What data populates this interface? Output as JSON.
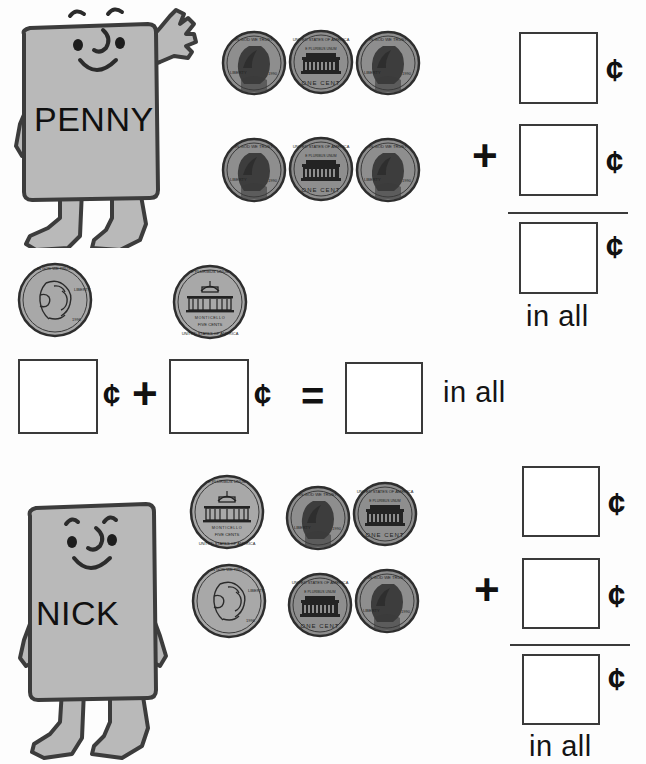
{
  "worksheet": {
    "background": "#fdfdfd",
    "ink": "#1a1a1a",
    "body_fill": "#b9b9b9",
    "coin_fill": "#8e8e8e",
    "width": 646,
    "height": 764
  },
  "symbols": {
    "cent": "¢",
    "plus": "+",
    "equals": "=",
    "in_all": "in all"
  },
  "problems": [
    {
      "id": "problem-1",
      "character": {
        "name": "PENNY",
        "pose": "waving"
      },
      "coins": [
        {
          "type": "penny",
          "face": "obverse"
        },
        {
          "type": "penny",
          "face": "reverse"
        },
        {
          "type": "penny",
          "face": "obverse"
        },
        {
          "type": "penny",
          "face": "obverse"
        },
        {
          "type": "penny",
          "face": "reverse"
        },
        {
          "type": "penny",
          "face": "obverse"
        }
      ],
      "format": "vertical",
      "answer_boxes": [
        {
          "slot": "addend-1",
          "value": "",
          "unit": "¢"
        },
        {
          "slot": "addend-2",
          "value": "",
          "unit": "¢"
        },
        {
          "slot": "sum",
          "value": "",
          "unit": "¢",
          "label": "in all"
        }
      ]
    },
    {
      "id": "problem-2",
      "character": null,
      "coins": [
        {
          "type": "nickel",
          "face": "obverse"
        },
        {
          "type": "nickel",
          "face": "reverse"
        }
      ],
      "format": "horizontal",
      "answer_boxes": [
        {
          "slot": "addend-1",
          "value": "",
          "unit": "¢"
        },
        {
          "slot": "addend-2",
          "value": "",
          "unit": "¢"
        },
        {
          "slot": "sum",
          "value": "",
          "unit": "",
          "label": "in all"
        }
      ]
    },
    {
      "id": "problem-3",
      "character": {
        "name": "NICK",
        "pose": "arms-down"
      },
      "coins": [
        {
          "type": "nickel",
          "face": "reverse"
        },
        {
          "type": "penny",
          "face": "obverse"
        },
        {
          "type": "penny",
          "face": "reverse"
        },
        {
          "type": "nickel",
          "face": "obverse"
        },
        {
          "type": "penny",
          "face": "reverse"
        },
        {
          "type": "penny",
          "face": "obverse"
        }
      ],
      "format": "vertical",
      "answer_boxes": [
        {
          "slot": "addend-1",
          "value": "",
          "unit": "¢"
        },
        {
          "slot": "addend-2",
          "value": "",
          "unit": "¢"
        },
        {
          "slot": "sum",
          "value": "",
          "unit": "¢",
          "label": "in all"
        }
      ]
    }
  ],
  "coin_legends": {
    "penny_obverse": {
      "motto": "IN GOD WE TRUST",
      "liberty": "LIBERTY",
      "date": "1990"
    },
    "penny_reverse": {
      "country": "UNITED STATES OF AMERICA",
      "motto": "E PLURIBUS UNUM",
      "denomination": "ONE CENT"
    },
    "nickel_obverse": {
      "motto": "IN GOD WE TRUST",
      "liberty": "LIBERTY",
      "date": "1996"
    },
    "nickel_reverse": {
      "motto": "E PLURIBUS UNUM",
      "building": "MONTICELLO",
      "denomination": "FIVE CENTS",
      "country": "UNITED STATES OF AMERICA"
    }
  }
}
